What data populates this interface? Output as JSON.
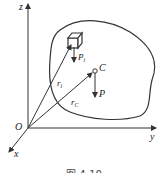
{
  "diagram": {
    "axes": {
      "z": "z",
      "y": "y",
      "x": "x",
      "origin": "O"
    },
    "labels": {
      "element_weight": "P",
      "element_weight_sub": "i",
      "position_vector": "r",
      "position_vector_sub": "i",
      "centroid": "C",
      "centroid_vector": "r",
      "centroid_vector_sub": "C",
      "total_weight": "P"
    },
    "caption": "图 4-10",
    "colors": {
      "stroke": "#333333",
      "background": "#ffffff"
    }
  }
}
